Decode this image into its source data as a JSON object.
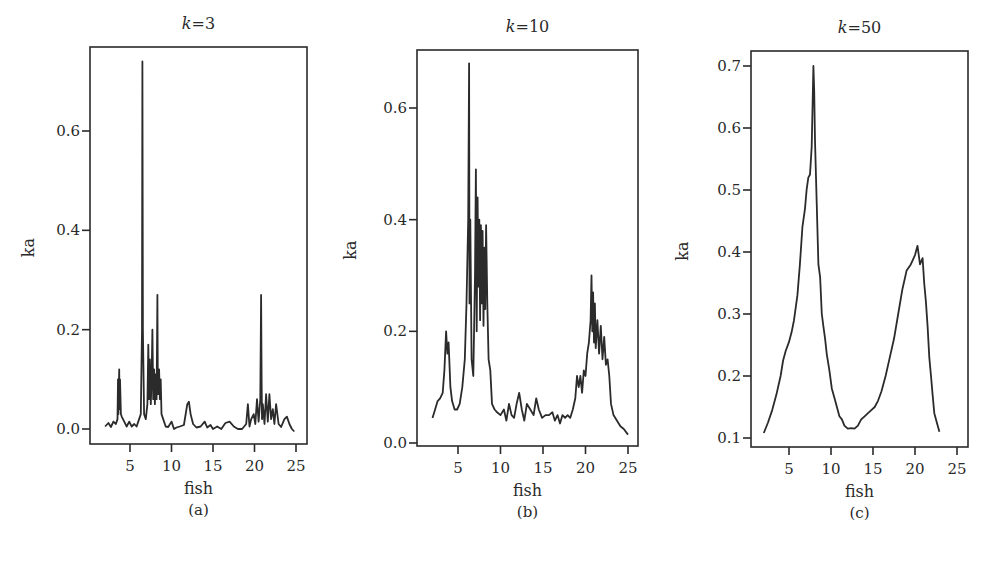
{
  "chart_data": [
    {
      "id": "a",
      "type": "line",
      "title": "k=3",
      "title_var": "k",
      "title_value": "3",
      "xlabel": "fish",
      "ylabel": "ka",
      "caption": "(a)",
      "xticks": [
        5,
        10,
        15,
        20,
        25
      ],
      "yticks": [
        0.0,
        0.2,
        0.4,
        0.6
      ],
      "ytick_labels": [
        "0.0",
        "0.2",
        "0.4",
        "0.6"
      ],
      "xlim": [
        0.2,
        26.3
      ],
      "ylim": [
        -0.03,
        0.77
      ],
      "grid": false,
      "series": [
        {
          "name": "ka",
          "x": [
            2.0,
            2.4,
            2.7,
            3.0,
            3.3,
            3.5,
            3.55,
            3.6,
            3.7,
            3.75,
            3.8,
            3.9,
            4.0,
            4.3,
            4.6,
            4.9,
            5.2,
            5.5,
            5.8,
            6.1,
            6.3,
            6.45,
            6.5,
            6.55,
            6.7,
            6.9,
            7.1,
            7.2,
            7.3,
            7.4,
            7.5,
            7.6,
            7.7,
            7.8,
            7.9,
            8.0,
            8.1,
            8.2,
            8.3,
            8.35,
            8.4,
            8.5,
            8.6,
            8.7,
            8.8,
            9.0,
            9.3,
            9.6,
            10.0,
            10.3,
            10.6,
            11.0,
            11.5,
            11.9,
            12.1,
            12.3,
            12.6,
            13.0,
            13.5,
            14.0,
            14.3,
            14.7,
            15.0,
            15.5,
            16.0,
            16.5,
            17.0,
            17.5,
            18.0,
            18.5,
            19.0,
            19.2,
            19.4,
            19.6,
            19.9,
            20.1,
            20.3,
            20.5,
            20.7,
            20.8,
            20.85,
            20.9,
            21.0,
            21.2,
            21.4,
            21.6,
            21.8,
            22.0,
            22.2,
            22.4,
            22.6,
            22.9,
            23.2,
            23.6,
            23.9,
            24.2,
            24.5,
            24.8
          ],
          "y": [
            0.005,
            0.012,
            0.004,
            0.015,
            0.01,
            0.02,
            0.1,
            0.03,
            0.12,
            0.04,
            0.1,
            0.03,
            0.025,
            0.015,
            0.005,
            0.015,
            0.005,
            0.01,
            0.005,
            0.02,
            0.03,
            0.2,
            0.74,
            0.2,
            0.03,
            0.02,
            0.05,
            0.17,
            0.06,
            0.14,
            0.05,
            0.1,
            0.2,
            0.06,
            0.12,
            0.05,
            0.11,
            0.06,
            0.27,
            0.1,
            0.07,
            0.12,
            0.06,
            0.1,
            0.03,
            0.02,
            0.005,
            0.004,
            0.015,
            0.0,
            0.003,
            0.005,
            0.008,
            0.05,
            0.055,
            0.03,
            0.01,
            0.003,
            0.005,
            0.015,
            0.003,
            0.008,
            0.0,
            0.005,
            0.0,
            0.012,
            0.015,
            0.005,
            0.0,
            0.0,
            0.01,
            0.05,
            0.005,
            0.02,
            0.03,
            0.01,
            0.06,
            0.015,
            0.06,
            0.27,
            0.1,
            0.02,
            0.05,
            0.01,
            0.07,
            0.015,
            0.07,
            0.02,
            0.04,
            0.01,
            0.05,
            0.01,
            0.004,
            0.02,
            0.025,
            0.01,
            0.0,
            -0.005
          ]
        }
      ]
    },
    {
      "id": "b",
      "type": "line",
      "title": "k=10",
      "title_var": "k",
      "title_value": "10",
      "xlabel": "fish",
      "ylabel": "ka",
      "caption": "(b)",
      "xticks": [
        5,
        10,
        15,
        20,
        25
      ],
      "yticks": [
        0.0,
        0.2,
        0.4,
        0.6
      ],
      "ytick_labels": [
        "0.0",
        "0.2",
        "0.4",
        "0.6"
      ],
      "xlim": [
        0.2,
        26.2
      ],
      "ylim": [
        -0.005,
        0.7
      ],
      "grid": false,
      "series": [
        {
          "name": "ka",
          "x": [
            2.0,
            2.3,
            2.6,
            2.9,
            3.2,
            3.4,
            3.6,
            3.75,
            3.9,
            4.1,
            4.3,
            4.6,
            4.9,
            5.2,
            5.5,
            5.8,
            6.0,
            6.2,
            6.3,
            6.35,
            6.45,
            6.6,
            6.8,
            7.0,
            7.1,
            7.2,
            7.3,
            7.4,
            7.5,
            7.6,
            7.7,
            7.8,
            7.9,
            8.0,
            8.1,
            8.2,
            8.3,
            8.45,
            8.6,
            8.8,
            9.0,
            9.3,
            9.6,
            10.0,
            10.4,
            10.7,
            11.0,
            11.3,
            11.6,
            11.9,
            12.2,
            12.5,
            12.8,
            13.1,
            13.5,
            13.9,
            14.2,
            14.5,
            14.9,
            15.3,
            15.7,
            16.1,
            16.4,
            16.7,
            17.0,
            17.3,
            17.6,
            17.9,
            18.2,
            18.5,
            18.8,
            19.0,
            19.2,
            19.4,
            19.6,
            19.8,
            20.0,
            20.2,
            20.4,
            20.6,
            20.7,
            20.8,
            20.9,
            21.0,
            21.1,
            21.2,
            21.4,
            21.6,
            21.8,
            22.0,
            22.2,
            22.4,
            22.6,
            22.8,
            23.0,
            23.3,
            23.7,
            24.1,
            24.5,
            25.0
          ],
          "y": [
            0.045,
            0.06,
            0.075,
            0.08,
            0.09,
            0.13,
            0.2,
            0.16,
            0.18,
            0.1,
            0.075,
            0.06,
            0.06,
            0.07,
            0.1,
            0.15,
            0.25,
            0.4,
            0.68,
            0.25,
            0.4,
            0.15,
            0.12,
            0.3,
            0.49,
            0.2,
            0.44,
            0.28,
            0.4,
            0.22,
            0.39,
            0.25,
            0.38,
            0.21,
            0.35,
            0.24,
            0.39,
            0.25,
            0.15,
            0.13,
            0.07,
            0.06,
            0.055,
            0.05,
            0.06,
            0.04,
            0.07,
            0.05,
            0.045,
            0.07,
            0.09,
            0.06,
            0.04,
            0.07,
            0.06,
            0.05,
            0.08,
            0.06,
            0.045,
            0.05,
            0.05,
            0.055,
            0.04,
            0.05,
            0.035,
            0.05,
            0.045,
            0.05,
            0.045,
            0.06,
            0.08,
            0.12,
            0.1,
            0.12,
            0.09,
            0.13,
            0.12,
            0.16,
            0.18,
            0.22,
            0.3,
            0.2,
            0.27,
            0.18,
            0.25,
            0.17,
            0.22,
            0.16,
            0.21,
            0.15,
            0.19,
            0.14,
            0.15,
            0.12,
            0.07,
            0.05,
            0.04,
            0.03,
            0.025,
            0.015
          ]
        }
      ]
    },
    {
      "id": "c",
      "type": "line",
      "title": "k=50",
      "title_var": "k",
      "title_value": "50",
      "xlabel": "fish",
      "ylabel": "ka",
      "caption": "(c)",
      "xticks": [
        5,
        10,
        15,
        20,
        25
      ],
      "yticks": [
        0.1,
        0.2,
        0.3,
        0.4,
        0.5,
        0.6,
        0.7
      ],
      "ytick_labels": [
        "0.1",
        "0.2",
        "0.3",
        "0.4",
        "0.5",
        "0.6",
        "0.7"
      ],
      "xlim": [
        0.5,
        26.3
      ],
      "ylim": [
        0.085,
        0.725
      ],
      "grid": false,
      "series": [
        {
          "name": "ka",
          "x": [
            2.0,
            2.5,
            3.0,
            3.5,
            4.0,
            4.3,
            4.6,
            5.0,
            5.3,
            5.6,
            6.0,
            6.3,
            6.6,
            6.9,
            7.1,
            7.3,
            7.5,
            7.7,
            7.9,
            8.0,
            8.1,
            8.3,
            8.5,
            8.7,
            8.9,
            9.1,
            9.3,
            9.5,
            9.8,
            10.1,
            10.4,
            10.7,
            11.0,
            11.3,
            11.6,
            12.0,
            12.4,
            12.8,
            13.2,
            13.6,
            14.0,
            14.4,
            14.8,
            15.2,
            15.6,
            16.0,
            16.5,
            17.0,
            17.5,
            18.0,
            18.5,
            19.0,
            19.5,
            20.0,
            20.3,
            20.6,
            20.9,
            21.1,
            21.3,
            21.5,
            21.7,
            21.9,
            22.1,
            22.3,
            22.6,
            22.9,
            23.2,
            23.6,
            24.0,
            24.4,
            24.8,
            25.2,
            25.6
          ],
          "y": [
            0.108,
            0.125,
            0.145,
            0.17,
            0.2,
            0.225,
            0.24,
            0.255,
            0.27,
            0.29,
            0.33,
            0.38,
            0.44,
            0.47,
            0.5,
            0.52,
            0.525,
            0.57,
            0.7,
            0.66,
            0.58,
            0.48,
            0.38,
            0.36,
            0.3,
            0.28,
            0.26,
            0.235,
            0.21,
            0.18,
            0.165,
            0.15,
            0.135,
            0.13,
            0.12,
            0.115,
            0.116,
            0.115,
            0.12,
            0.13,
            0.135,
            0.14,
            0.145,
            0.15,
            0.16,
            0.175,
            0.2,
            0.23,
            0.26,
            0.3,
            0.34,
            0.37,
            0.38,
            0.395,
            0.41,
            0.38,
            0.39,
            0.35,
            0.32,
            0.28,
            0.23,
            0.2,
            0.17,
            0.14,
            0.125,
            0.11
          ],
          "note": "values approximate"
        }
      ]
    }
  ]
}
